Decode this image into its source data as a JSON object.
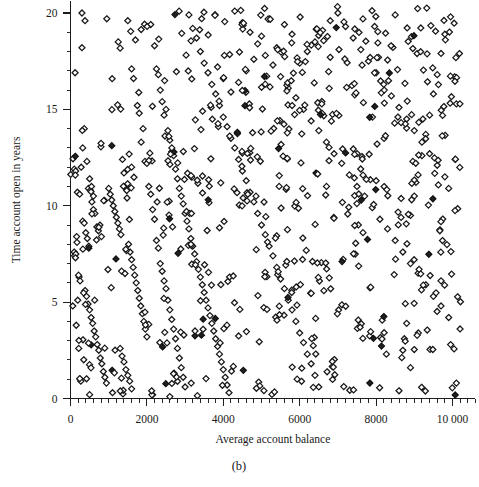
{
  "figure": {
    "caption": "(b)",
    "caption_name": "figure-caption"
  },
  "chart_data": {
    "type": "scatter",
    "title": "",
    "xlabel": "Average account balance",
    "ylabel": "Time account open in years",
    "xlim": [
      0,
      10600
    ],
    "ylim": [
      0,
      20.6
    ],
    "xticks": [
      0,
      2000,
      4000,
      6000,
      8000,
      10000
    ],
    "xticklabels": [
      "0",
      "2000",
      "4000",
      "6000",
      "8000",
      "10 000"
    ],
    "yticks": [
      0,
      5,
      10,
      15,
      20
    ],
    "yticklabels": [
      "0",
      "5",
      "10",
      "15",
      "20"
    ],
    "x_minor_step": 200,
    "y_minor_step": 1,
    "grid": false,
    "legend": null,
    "marker": "diamond-open",
    "marker_color": "#171717",
    "marker_fill": "#ffffff",
    "n_points": 880,
    "points": [
      [
        120,
        16.9
      ],
      [
        300,
        20.0
      ],
      [
        380,
        19.6
      ],
      [
        500,
        0.2
      ],
      [
        180,
        10.7
      ],
      [
        240,
        10.6
      ],
      [
        60,
        4.8
      ],
      [
        150,
        3.8
      ],
      [
        250,
        1.0
      ],
      [
        270,
        0.9
      ],
      [
        215,
        2.6
      ],
      [
        190,
        5.1
      ],
      [
        95,
        7.6
      ],
      [
        105,
        7.4
      ],
      [
        140,
        7.5
      ],
      [
        130,
        7.3
      ],
      [
        160,
        8.4
      ],
      [
        170,
        8.1
      ],
      [
        225,
        6.3
      ],
      [
        250,
        6.1
      ],
      [
        210,
        6.4
      ],
      [
        100,
        11.9
      ],
      [
        135,
        11.8
      ],
      [
        280,
        12.0
      ],
      [
        320,
        13.0
      ],
      [
        360,
        14.0
      ],
      [
        430,
        12.3
      ],
      [
        470,
        10.9
      ],
      [
        520,
        10.8
      ],
      [
        560,
        10.2
      ],
      [
        600,
        9.8
      ],
      [
        640,
        9.6
      ],
      [
        690,
        8.9
      ],
      [
        730,
        8.7
      ],
      [
        770,
        9.0
      ],
      [
        810,
        8.4
      ],
      [
        300,
        18.2
      ],
      [
        500,
        11.4
      ],
      [
        550,
        11.0
      ],
      [
        600,
        10.5
      ],
      [
        320,
        9.2
      ],
      [
        360,
        9.1
      ],
      [
        400,
        8.6
      ],
      [
        440,
        8.3
      ],
      [
        480,
        7.9
      ],
      [
        380,
        5.6
      ],
      [
        420,
        5.3
      ],
      [
        460,
        4.9
      ],
      [
        500,
        4.6
      ],
      [
        540,
        4.2
      ],
      [
        580,
        3.9
      ],
      [
        620,
        3.5
      ],
      [
        660,
        3.2
      ],
      [
        700,
        2.8
      ],
      [
        740,
        2.5
      ],
      [
        780,
        2.1
      ],
      [
        820,
        1.8
      ],
      [
        860,
        1.4
      ],
      [
        900,
        1.1
      ],
      [
        940,
        0.8
      ],
      [
        1000,
        10.9
      ],
      [
        1040,
        10.6
      ],
      [
        1080,
        10.3
      ],
      [
        1120,
        10.0
      ],
      [
        1160,
        9.7
      ],
      [
        1200,
        9.4
      ],
      [
        1240,
        9.1
      ],
      [
        1280,
        8.8
      ],
      [
        1320,
        8.5
      ],
      [
        1360,
        12.4
      ],
      [
        1400,
        11.7
      ],
      [
        1440,
        11.0
      ],
      [
        1480,
        10.4
      ],
      [
        1520,
        8.0
      ],
      [
        1560,
        7.6
      ],
      [
        1600,
        7.2
      ],
      [
        1640,
        6.8
      ],
      [
        1680,
        6.4
      ],
      [
        1720,
        6.0
      ],
      [
        1760,
        5.6
      ],
      [
        1800,
        5.2
      ],
      [
        1840,
        4.8
      ],
      [
        1880,
        4.4
      ],
      [
        1920,
        4.0
      ],
      [
        1960,
        3.6
      ],
      [
        2000,
        3.2
      ],
      [
        1300,
        2.6
      ],
      [
        1350,
        2.2
      ],
      [
        1400,
        1.9
      ],
      [
        1450,
        1.5
      ],
      [
        1500,
        1.2
      ],
      [
        1550,
        0.9
      ],
      [
        1600,
        0.5
      ],
      [
        1100,
        0.3
      ],
      [
        950,
        19.7
      ],
      [
        1250,
        18.5
      ],
      [
        1500,
        19.6
      ],
      [
        1600,
        17.1
      ],
      [
        1650,
        16.6
      ],
      [
        1700,
        18.6
      ],
      [
        1750,
        15.2
      ],
      [
        1800,
        14.8
      ],
      [
        1850,
        13.3
      ],
      [
        1900,
        14.0
      ],
      [
        1950,
        12.3
      ],
      [
        2000,
        12.2
      ],
      [
        2050,
        11.0
      ],
      [
        2100,
        10.6
      ],
      [
        2150,
        9.8
      ],
      [
        2200,
        9.3
      ],
      [
        2250,
        8.2
      ],
      [
        2300,
        7.8
      ],
      [
        2350,
        7.0
      ],
      [
        2400,
        6.6
      ],
      [
        2450,
        6.1
      ],
      [
        2500,
        5.7
      ],
      [
        2550,
        5.1
      ],
      [
        2600,
        4.6
      ],
      [
        2650,
        4.1
      ],
      [
        2700,
        3.6
      ],
      [
        2750,
        3.1
      ],
      [
        2800,
        2.6
      ],
      [
        2850,
        2.1
      ],
      [
        2900,
        1.6
      ],
      [
        2950,
        1.1
      ],
      [
        3000,
        0.6
      ],
      [
        2150,
        0.2
      ],
      [
        2600,
        0.1
      ],
      [
        2100,
        19.4
      ],
      [
        2200,
        18.3
      ],
      [
        2250,
        17.1
      ],
      [
        2300,
        16.8
      ],
      [
        2350,
        16.0
      ],
      [
        2400,
        15.4
      ],
      [
        2450,
        14.7
      ],
      [
        2500,
        15.0
      ],
      [
        2550,
        13.9
      ],
      [
        2600,
        13.4
      ],
      [
        2650,
        12.8
      ],
      [
        2700,
        12.6
      ],
      [
        2750,
        11.9
      ],
      [
        2800,
        11.4
      ],
      [
        2850,
        10.9
      ],
      [
        2900,
        10.5
      ],
      [
        2950,
        10.1
      ],
      [
        3000,
        9.6
      ],
      [
        3050,
        9.2
      ],
      [
        3100,
        8.8
      ],
      [
        3150,
        8.3
      ],
      [
        3200,
        7.9
      ],
      [
        3250,
        7.5
      ],
      [
        3300,
        7.1
      ],
      [
        3350,
        6.7
      ],
      [
        3400,
        6.3
      ],
      [
        3450,
        5.9
      ],
      [
        3500,
        5.5
      ],
      [
        3550,
        5.1
      ],
      [
        3600,
        4.7
      ],
      [
        3650,
        4.3
      ],
      [
        3700,
        3.9
      ],
      [
        3750,
        3.5
      ],
      [
        3800,
        3.1
      ],
      [
        3850,
        2.7
      ],
      [
        3900,
        2.3
      ],
      [
        3950,
        1.9
      ],
      [
        4000,
        1.5
      ],
      [
        4050,
        1.1
      ],
      [
        4100,
        0.7
      ],
      [
        4150,
        0.3
      ],
      [
        3100,
        19.9
      ],
      [
        3200,
        19.2
      ],
      [
        3300,
        18.7
      ],
      [
        3400,
        18.0
      ],
      [
        3500,
        17.4
      ],
      [
        3600,
        16.9
      ],
      [
        3700,
        16.3
      ],
      [
        3800,
        15.8
      ],
      [
        3900,
        15.2
      ],
      [
        4000,
        14.6
      ],
      [
        4100,
        14.1
      ],
      [
        4200,
        13.5
      ],
      [
        4300,
        13.0
      ],
      [
        4400,
        12.4
      ],
      [
        4500,
        11.8
      ],
      [
        4600,
        11.3
      ],
      [
        4700,
        10.7
      ],
      [
        4800,
        10.2
      ],
      [
        4900,
        9.6
      ],
      [
        5000,
        9.0
      ],
      [
        5100,
        8.5
      ],
      [
        5200,
        7.9
      ],
      [
        5300,
        7.4
      ],
      [
        5400,
        6.8
      ],
      [
        5500,
        6.2
      ],
      [
        5600,
        5.7
      ],
      [
        5700,
        5.1
      ],
      [
        5800,
        4.6
      ],
      [
        5900,
        4.0
      ],
      [
        6000,
        3.4
      ],
      [
        6100,
        2.9
      ],
      [
        6200,
        2.3
      ],
      [
        6300,
        1.8
      ],
      [
        6400,
        1.2
      ],
      [
        6500,
        0.6
      ],
      [
        4300,
        20.1
      ],
      [
        4500,
        19.5
      ],
      [
        4700,
        19.0
      ],
      [
        4900,
        18.4
      ],
      [
        5100,
        17.8
      ],
      [
        5300,
        17.3
      ],
      [
        5500,
        16.7
      ],
      [
        5700,
        16.1
      ],
      [
        5900,
        15.6
      ],
      [
        6100,
        15.0
      ],
      [
        6300,
        14.4
      ],
      [
        6500,
        13.9
      ],
      [
        6700,
        13.3
      ],
      [
        6900,
        12.7
      ],
      [
        7100,
        12.2
      ],
      [
        7300,
        11.6
      ],
      [
        7500,
        11.0
      ],
      [
        7700,
        10.5
      ],
      [
        7900,
        9.9
      ],
      [
        8100,
        9.3
      ],
      [
        8300,
        8.8
      ],
      [
        8500,
        8.2
      ],
      [
        8700,
        7.6
      ],
      [
        8900,
        7.0
      ],
      [
        9100,
        6.5
      ],
      [
        9300,
        5.9
      ],
      [
        9500,
        5.3
      ],
      [
        9700,
        4.8
      ],
      [
        9900,
        4.2
      ],
      [
        9950,
        19.8
      ],
      [
        9800,
        18.9
      ],
      [
        9700,
        17.9
      ],
      [
        9600,
        16.8
      ],
      [
        9500,
        15.8
      ],
      [
        9400,
        14.7
      ],
      [
        9300,
        13.7
      ],
      [
        9200,
        12.6
      ],
      [
        9100,
        11.6
      ],
      [
        9000,
        10.5
      ],
      [
        8900,
        9.5
      ],
      [
        8800,
        3.9
      ],
      [
        8700,
        2.5
      ],
      [
        8600,
        0.4
      ],
      [
        8900,
        1.6
      ],
      [
        7000,
        20.0
      ],
      [
        7200,
        19.3
      ],
      [
        7400,
        18.7
      ],
      [
        7600,
        18.1
      ],
      [
        7800,
        17.5
      ],
      [
        8000,
        16.9
      ],
      [
        8200,
        16.3
      ],
      [
        8400,
        15.7
      ],
      [
        8600,
        15.1
      ],
      [
        8800,
        14.5
      ],
      [
        9000,
        13.9
      ],
      [
        9200,
        13.3
      ],
      [
        9400,
        12.7
      ],
      [
        9600,
        12.1
      ],
      [
        9800,
        11.5
      ],
      [
        9900,
        10.9
      ],
      [
        6800,
        19.6
      ],
      [
        6600,
        19.1
      ],
      [
        6400,
        18.5
      ],
      [
        6200,
        18.0
      ],
      [
        6000,
        17.4
      ],
      [
        5800,
        18.9
      ],
      [
        5600,
        19.4
      ],
      [
        5400,
        18.2
      ],
      [
        5200,
        19.7
      ],
      [
        5000,
        18.8
      ],
      [
        4800,
        17.6
      ],
      [
        4600,
        17.0
      ],
      [
        4400,
        16.4
      ],
      [
        4200,
        15.9
      ],
      [
        4000,
        16.6
      ],
      [
        3850,
        17.2
      ]
    ]
  }
}
